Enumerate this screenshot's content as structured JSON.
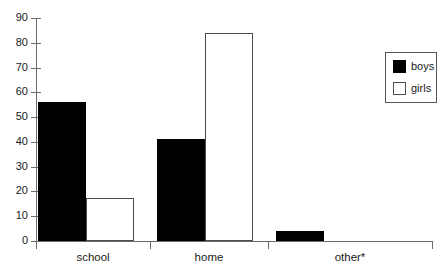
{
  "chart_data": {
    "type": "bar",
    "title": "",
    "subtitle": "",
    "xlabel": "",
    "ylabel": "",
    "categories": [
      "school",
      "home",
      "other*"
    ],
    "series": [
      {
        "name": "boys",
        "color": "#000000",
        "fill": "solid",
        "values": [
          56,
          41,
          4
        ]
      },
      {
        "name": "girls",
        "color": "#ffffff",
        "fill": "outline",
        "values": [
          17.5,
          84,
          0
        ]
      }
    ],
    "ylim": [
      0,
      90
    ],
    "ytick_step": 10,
    "yticks": [
      0,
      10,
      20,
      30,
      40,
      50,
      60,
      70,
      80,
      90
    ],
    "ytick_labels": [
      "0",
      "10",
      "20",
      "30",
      "40",
      "50",
      "60",
      "70",
      "80",
      "90"
    ],
    "grid": false,
    "legend_position": "right-top",
    "legend_entries": [
      "boys",
      "girls"
    ],
    "annotations": [
      "other*"
    ]
  },
  "axis": {
    "y_labels": [
      "90",
      "80",
      "70",
      "60",
      "50",
      "40",
      "30",
      "20",
      "10",
      "0"
    ],
    "x_labels": [
      "school",
      "home",
      "other*"
    ]
  },
  "legend": {
    "boys_label": "boys",
    "girls_label": "girls"
  }
}
